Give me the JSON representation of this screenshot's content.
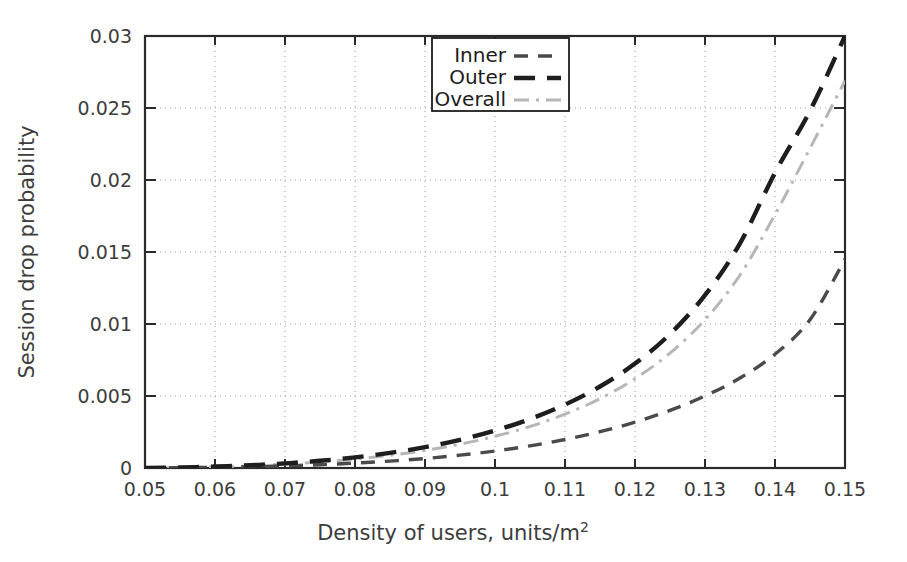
{
  "chart_data": {
    "type": "line",
    "title": "",
    "xlabel": "Density of users, units/m2",
    "xlabel_base": "Density of users, units/m",
    "xlabel_superscript": "2",
    "ylabel": "Session drop probability",
    "xlim": [
      0.05,
      0.15
    ],
    "ylim": [
      0,
      0.03
    ],
    "xticks": [
      "0.05",
      "0.06",
      "0.07",
      "0.08",
      "0.09",
      "0.1",
      "0.11",
      "0.12",
      "0.13",
      "0.14",
      "0.15"
    ],
    "xtick_values": [
      0.05,
      0.06,
      0.07,
      0.08,
      0.09,
      0.1,
      0.11,
      0.12,
      0.13,
      0.14,
      0.15
    ],
    "yticks": [
      "0",
      "0.005",
      "0.01",
      "0.015",
      "0.02",
      "0.025",
      "0.03"
    ],
    "ytick_values": [
      0,
      0.005,
      0.01,
      0.015,
      0.02,
      0.025,
      0.03
    ],
    "grid": true,
    "grid_style": "dotted",
    "legend_position": "top-center",
    "x": [
      0.05,
      0.055,
      0.06,
      0.065,
      0.07,
      0.075,
      0.08,
      0.085,
      0.09,
      0.095,
      0.1,
      0.105,
      0.11,
      0.115,
      0.12,
      0.125,
      0.13,
      0.135,
      0.14,
      0.145,
      0.15
    ],
    "series": [
      {
        "name": "Inner",
        "color": "#4a4a4a",
        "dash": "14,10",
        "width": 3.4,
        "values": [
          0.0,
          2e-05,
          5e-05,
          9e-05,
          0.00015,
          0.00023,
          0.00034,
          0.00048,
          0.00066,
          0.00089,
          0.00118,
          0.00154,
          0.00198,
          0.00252,
          0.00318,
          0.004,
          0.005,
          0.00625,
          0.0079,
          0.0103,
          0.0145
        ]
      },
      {
        "name": "Outer",
        "color": "#1e1e1e",
        "dash": "21,12",
        "width": 4.4,
        "values": [
          0.0,
          4e-05,
          0.0001,
          0.00019,
          0.00032,
          0.0005,
          0.00074,
          0.00105,
          0.00145,
          0.00196,
          0.0026,
          0.0034,
          0.0044,
          0.00566,
          0.00725,
          0.0093,
          0.012,
          0.0156,
          0.0205,
          0.0248,
          0.03
        ]
      },
      {
        "name": "Overall",
        "color": "#b6b6b6",
        "dash": "15,7,3,7",
        "width": 3.0,
        "values": [
          0.0,
          3e-05,
          8e-05,
          0.00015,
          0.00026,
          0.00041,
          0.00061,
          0.00088,
          0.00122,
          0.00165,
          0.0022,
          0.00288,
          0.00374,
          0.00482,
          0.0062,
          0.00798,
          0.0103,
          0.0134,
          0.0176,
          0.0222,
          0.0269
        ]
      }
    ]
  },
  "legend": {
    "entries": [
      {
        "label": "Inner"
      },
      {
        "label": "Outer"
      },
      {
        "label": "Overall"
      }
    ]
  }
}
